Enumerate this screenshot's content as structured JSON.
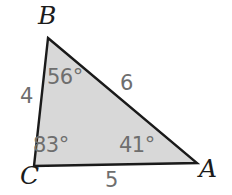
{
  "figure": {
    "type": "triangle-diagram",
    "background_color": "#ffffff",
    "fill_color": "#d8d8d8",
    "stroke_color": "#1a1a1a",
    "stroke_width": 2,
    "measure_label_color": "#6e6e6e",
    "vertex_label_color": "#1b1b1b",
    "vertices": {
      "A": {
        "label": "A",
        "x": 197,
        "y": 163
      },
      "B": {
        "label": "B",
        "x": 48,
        "y": 38
      },
      "C": {
        "label": "C",
        "x": 34,
        "y": 166
      }
    },
    "angles": {
      "A": "41°",
      "B": "56°",
      "C": "83°"
    },
    "sides": {
      "BC": "4",
      "BA": "6",
      "CA": "5"
    }
  }
}
